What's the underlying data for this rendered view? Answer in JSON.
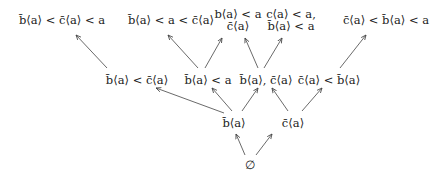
{
  "diagram": {
    "type": "hasse-diagram",
    "nodes": {
      "bottom": {
        "lines": [
          "∅"
        ],
        "x": 250,
        "y": 163
      },
      "b_bar": {
        "lines": [
          "b̄⟨a⟩"
        ],
        "x": 234,
        "y": 119
      },
      "c_bar": {
        "lines": [
          "c̄⟨a⟩"
        ],
        "x": 293,
        "y": 119
      },
      "mid_1": {
        "lines": [
          "b̄⟨a⟩ < c̄⟨a⟩"
        ],
        "x": 137,
        "y": 76
      },
      "mid_2": {
        "lines": [
          "b̄⟨a⟩ < a"
        ],
        "x": 208,
        "y": 76
      },
      "mid_3": {
        "lines": [
          "b̄⟨a⟩, c̄⟨a⟩"
        ],
        "x": 266,
        "y": 76
      },
      "mid_4": {
        "lines": [
          "c̄⟨a⟩ < b̄⟨a⟩"
        ],
        "x": 329,
        "y": 76
      },
      "top_1": {
        "lines": [
          "b̄⟨a⟩ < c̄⟨a⟩ < a"
        ],
        "x": 62,
        "y": 18
      },
      "top_2": {
        "lines": [
          "b̄⟨a⟩ < a < c̄⟨a⟩"
        ],
        "x": 171,
        "y": 18
      },
      "top_3": {
        "lines": [
          "b⟨a⟩ < a",
          "c̄⟨a⟩"
        ],
        "x": 238,
        "y": 12
      },
      "top_4": {
        "lines": [
          "c⟨a⟩ < a,",
          "b̄⟨a⟩ < a"
        ],
        "x": 289,
        "y": 12
      },
      "top_5": {
        "lines": [
          "c̄⟨a⟩ < b̄⟨a⟩ < a"
        ],
        "x": 386,
        "y": 18
      }
    },
    "edges": [
      {
        "from": "bottom",
        "to": "b_bar"
      },
      {
        "from": "bottom",
        "to": "c_bar"
      },
      {
        "from": "b_bar",
        "to": "mid_1"
      },
      {
        "from": "b_bar",
        "to": "mid_2"
      },
      {
        "from": "b_bar",
        "to": "mid_3"
      },
      {
        "from": "c_bar",
        "to": "mid_3"
      },
      {
        "from": "c_bar",
        "to": "mid_4"
      },
      {
        "from": "mid_1",
        "to": "top_1"
      },
      {
        "from": "mid_2",
        "to": "top_2"
      },
      {
        "from": "mid_2",
        "to": "top_3"
      },
      {
        "from": "mid_3",
        "to": "top_3"
      },
      {
        "from": "mid_3",
        "to": "top_4"
      },
      {
        "from": "mid_4",
        "to": "top_5"
      }
    ],
    "colors": {
      "text": "#222222",
      "edge": "#444444",
      "background": "#ffffff"
    }
  }
}
